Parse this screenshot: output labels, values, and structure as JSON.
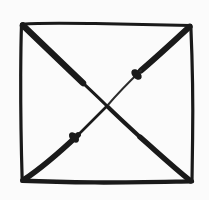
{
  "image": {
    "kind": "hand-drawn-line-figure",
    "description": "Hand-drawn square with both diagonals crossing in the center forming an X",
    "width": 209,
    "height": 200,
    "background_color": "#fbfbfb",
    "ink_color": "#1a1a1a",
    "ink_color_light": "#2b2b2b"
  },
  "figure": {
    "name": "square-with-diagonals",
    "shape_label": "square",
    "overlay_label": "X",
    "stroke_count": 6,
    "bounds": {
      "left": 20,
      "top": 22,
      "right": 192,
      "bottom": 182
    },
    "center": {
      "x": 107,
      "y": 106
    },
    "corners": [
      {
        "name": "top-left",
        "x": 21,
        "y": 23
      },
      {
        "name": "top-right",
        "x": 191,
        "y": 25
      },
      {
        "name": "bottom-right",
        "x": 192,
        "y": 182
      },
      {
        "name": "bottom-left",
        "x": 22,
        "y": 181
      }
    ],
    "strokes": [
      {
        "name": "square-top-edge",
        "role": "border",
        "path": "M21.5 24.2 C 45 22.4, 70 23.1, 95 23.6 C 122 24.2, 152 24.4, 190.5 25.4",
        "width": 3.0,
        "color": "#1a1a1a"
      },
      {
        "name": "square-right-edge",
        "role": "border",
        "path": "M190.8 25.4 C 192.4 62, 193.2 100, 192.6 138 C 192.3 156, 192.2 170, 192.0 181.6",
        "width": 3.2,
        "color": "#1a1a1a"
      },
      {
        "name": "square-bottom-edge",
        "role": "border",
        "path": "M192.0 181.4 C 160 181.9, 126 182.6, 95 182.4 C 66 182.2, 42 181.6, 22.2 180.8",
        "width": 4.4,
        "color": "#1a1a1a"
      },
      {
        "name": "square-left-edge",
        "role": "border",
        "path": "M22.2 180.8 C 21.2 148, 20.6 112, 20.7 76 C 20.8 54, 21.1 36, 21.5 24.2",
        "width": 3.2,
        "color": "#1a1a1a"
      },
      {
        "name": "diagonal-top-left-to-bottom-right",
        "role": "diagonal",
        "from_corner": "top-left",
        "to_corner": "bottom-right",
        "taper": "thick at corners, thin at center",
        "segments": [
          {
            "path": "M23.0 25.5 C 40 42, 62 63, 83 83",
            "width": 6.4
          },
          {
            "path": "M83 83 C 92 91.5, 100 99, 107 106",
            "width": 3.0
          },
          {
            "path": "M107 106 C 116 115, 128 126, 140 137",
            "width": 4.0
          },
          {
            "path": "M140 137 C 155 150, 172 166, 190.5 180.8",
            "width": 5.4
          }
        ]
      },
      {
        "name": "diagonal-top-right-to-bottom-left",
        "role": "diagonal",
        "from_corner": "top-right",
        "to_corner": "bottom-left",
        "taper": "thick at corners, very thin near center, ink blobs mid-run",
        "segments": [
          {
            "path": "M189.6 26.8 C 175 40, 158 56, 141 70.5",
            "width": 6.0
          },
          {
            "path": "M141 70.5 C 131 80, 119 92, 107 106",
            "width": 2.0
          },
          {
            "path": "M107 106 C 98 115, 87 126, 78 135",
            "width": 2.6
          },
          {
            "path": "M78 135 C 60 152, 40 169, 23.5 180.0",
            "width": 5.8
          }
        ],
        "blobs": [
          {
            "name": "ink-blob-upper-right",
            "x": 136.5,
            "y": 74.5,
            "rx": 4.1,
            "ry": 6.2,
            "rotate": -43
          },
          {
            "name": "ink-blob-lower-left",
            "x": 74.0,
            "y": 137.5,
            "rx": 4.0,
            "ry": 6.0,
            "rotate": -43
          }
        ]
      }
    ]
  }
}
